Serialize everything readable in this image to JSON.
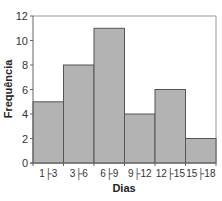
{
  "chart_data": {
    "type": "bar",
    "title": "",
    "xlabel": "Dias",
    "ylabel": "Frequência",
    "categories": [
      "1├3",
      "3├6",
      "6├9",
      "9├12",
      "12├15",
      "15├18"
    ],
    "values": [
      5,
      8,
      11,
      4,
      6,
      2
    ],
    "ylim": [
      0,
      12
    ],
    "yticks": [
      0,
      2,
      4,
      6,
      8,
      10,
      12
    ],
    "grid": false,
    "legend": null,
    "histogram": true
  },
  "colors": {
    "bar_fill": "#b3b3b3",
    "bar_stroke": "#555555",
    "axis": "#666666",
    "plot_border": "#999999"
  },
  "layout": {
    "plot_left": 33,
    "plot_right": 216,
    "plot_top": 16,
    "plot_bottom": 163
  }
}
